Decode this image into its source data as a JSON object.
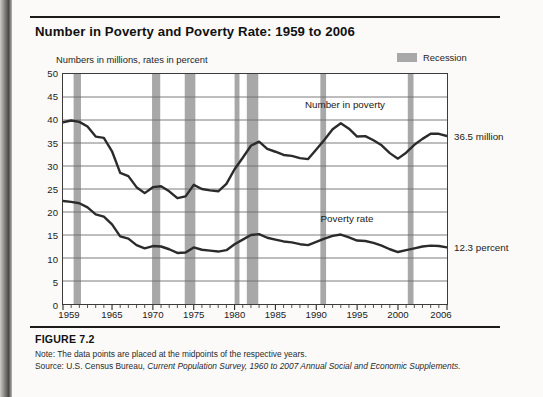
{
  "figure": {
    "title": "Number in Poverty and Poverty Rate: 1959 to 2006",
    "axis_note": "Numbers in millions, rates in percent",
    "number_label": "FIGURE 7.2",
    "note": "Note: The data points are placed at the midpoints of the respective years.",
    "source_prefix": "Source: U.S. Census Bureau, ",
    "source_italic": "Current Population Survey, 1960 to 2007 Annual Social and Economic Supplements."
  },
  "legend": {
    "recession_label": "Recession",
    "recession_color": "#a8a8a8"
  },
  "annotations": {
    "number_in_poverty": "Number in poverty",
    "poverty_rate": "Poverty rate",
    "end_number_value": "36.5 million",
    "end_rate_value": "12.3 percent"
  },
  "chart_data": {
    "type": "line",
    "title": "Number in Poverty and Poverty Rate: 1959 to 2006",
    "xlabel": "",
    "ylabel": "Numbers in millions, rates in percent",
    "xlim": [
      1959,
      2006
    ],
    "ylim": [
      0,
      50
    ],
    "ytick_step": 5,
    "yticks": [
      0,
      5,
      10,
      15,
      20,
      25,
      30,
      35,
      40,
      45,
      50
    ],
    "xticks": [
      1959,
      1965,
      1970,
      1975,
      1980,
      1985,
      1990,
      1995,
      2000,
      2006
    ],
    "xtick_minor_step": 1,
    "grid": true,
    "legend_position": "top-right",
    "line_color": "#2b2b2b",
    "x": [
      1959,
      1960,
      1961,
      1962,
      1963,
      1964,
      1965,
      1966,
      1967,
      1968,
      1969,
      1970,
      1971,
      1972,
      1973,
      1974,
      1975,
      1976,
      1977,
      1978,
      1979,
      1980,
      1981,
      1982,
      1983,
      1984,
      1985,
      1986,
      1987,
      1988,
      1989,
      1990,
      1991,
      1992,
      1993,
      1994,
      1995,
      1996,
      1997,
      1998,
      1999,
      2000,
      2001,
      2002,
      2003,
      2004,
      2005,
      2006
    ],
    "series": [
      {
        "name": "Number in poverty",
        "unit": "millions",
        "end_value": 36.5,
        "values": [
          39.5,
          39.9,
          39.6,
          38.6,
          36.4,
          36.1,
          33.2,
          28.5,
          27.8,
          25.4,
          24.1,
          25.4,
          25.6,
          24.5,
          23.0,
          23.4,
          25.9,
          25.0,
          24.7,
          24.5,
          26.1,
          29.3,
          31.8,
          34.4,
          35.3,
          33.7,
          33.1,
          32.4,
          32.2,
          31.7,
          31.5,
          33.6,
          35.7,
          38.0,
          39.3,
          38.1,
          36.4,
          36.5,
          35.6,
          34.5,
          32.8,
          31.6,
          32.9,
          34.6,
          35.9,
          37.0,
          37.0,
          36.5
        ]
      },
      {
        "name": "Poverty rate",
        "unit": "percent",
        "end_value": 12.3,
        "values": [
          22.4,
          22.2,
          21.9,
          21.0,
          19.5,
          19.0,
          17.3,
          14.7,
          14.2,
          12.8,
          12.1,
          12.6,
          12.5,
          11.9,
          11.1,
          11.2,
          12.3,
          11.8,
          11.6,
          11.4,
          11.7,
          13.0,
          14.0,
          15.0,
          15.2,
          14.4,
          14.0,
          13.6,
          13.4,
          13.0,
          12.8,
          13.5,
          14.2,
          14.8,
          15.1,
          14.5,
          13.8,
          13.7,
          13.3,
          12.7,
          11.9,
          11.3,
          11.7,
          12.1,
          12.5,
          12.7,
          12.6,
          12.3
        ]
      }
    ],
    "recession_bands": [
      {
        "start": 1960.3,
        "end": 1961.2
      },
      {
        "start": 1969.9,
        "end": 1970.9
      },
      {
        "start": 1973.9,
        "end": 1975.2
      },
      {
        "start": 1980.0,
        "end": 1980.6
      },
      {
        "start": 1981.5,
        "end": 1982.9
      },
      {
        "start": 1990.5,
        "end": 1991.2
      },
      {
        "start": 2001.2,
        "end": 2001.9
      }
    ]
  }
}
